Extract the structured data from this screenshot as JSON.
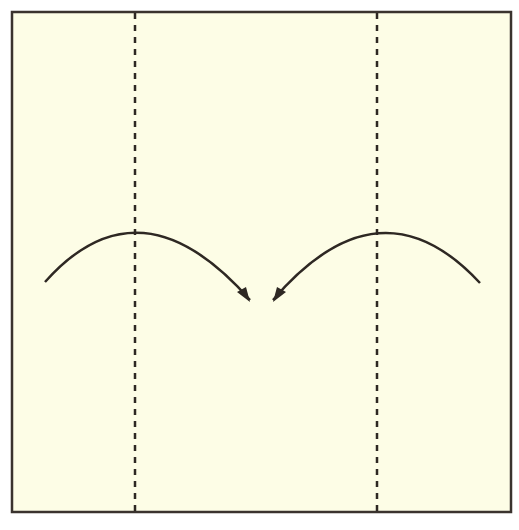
{
  "diagram": {
    "title": "",
    "paper": {
      "x": 12,
      "y": 12,
      "width": 499,
      "height": 500,
      "fill": "#fdfde6",
      "stroke": "#3a332e"
    },
    "valley_folds": [
      {
        "x": 135,
        "y1": 13,
        "y2": 511
      },
      {
        "x": 377,
        "y1": 13,
        "y2": 511
      }
    ],
    "arrows": [
      {
        "direction": "right",
        "path": "M45,282 Q140,175 250,300",
        "head": "250,302 237,292 246,287"
      },
      {
        "direction": "left",
        "path": "M480,283 Q380,175 273,300",
        "head": "273,302 286,292 277,287"
      }
    ],
    "colors": {
      "line": "#2e2823",
      "background": "#ffffff"
    }
  }
}
